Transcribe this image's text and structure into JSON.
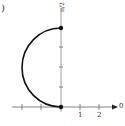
{
  "figure": {
    "part_label": ")",
    "polar_axis_label": "0",
    "vertical_axis_label": "π/2",
    "tick_labels": [
      "1",
      "2"
    ],
    "curve": "semicircle",
    "endpoints": [
      "pole",
      "top"
    ],
    "colors": {
      "curve": "#111111",
      "axis": "#555555"
    }
  }
}
